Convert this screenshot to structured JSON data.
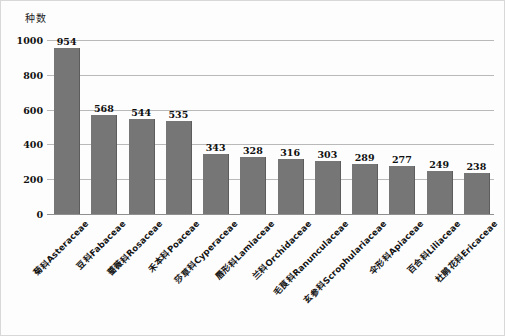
{
  "chart_data": {
    "type": "bar",
    "title": "",
    "xlabel": "",
    "ylabel": "种数",
    "ylim": [
      0,
      1000
    ],
    "ytick_labels": [
      "1000",
      "800",
      "600",
      "400",
      "200",
      "0"
    ],
    "ytick_values": [
      1000,
      800,
      600,
      400,
      200,
      0
    ],
    "grid": true,
    "legend": "none",
    "bar_color": "#767676",
    "categories": [
      "菊科Asteraceae",
      "豆科Fabaceae",
      "蔷薇科Rosaceae",
      "禾本科Poaceae",
      "莎草科Cyperaceae",
      "唇形科Lamiaceae",
      "兰科Orchidaceae",
      "毛茛科Ranunculaceae",
      "玄参科Scrophulariaceae",
      "伞形科Apiaceae",
      "百合科Liliaceae",
      "杜鹃花科Ericaceae"
    ],
    "values": [
      954,
      568,
      544,
      535,
      343,
      328,
      316,
      303,
      289,
      277,
      249,
      238
    ],
    "value_labels": [
      "954",
      "568",
      "544",
      "535",
      "343",
      "328",
      "316",
      "303",
      "289",
      "277",
      "249",
      "238"
    ]
  }
}
